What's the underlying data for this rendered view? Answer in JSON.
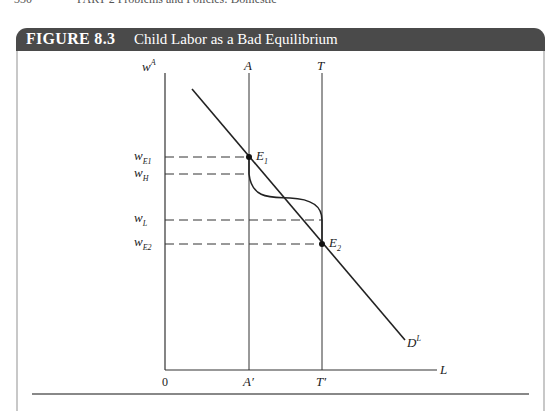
{
  "running_header": {
    "page_number": "330",
    "text": "PART 2   Problems and Policies: Domestic"
  },
  "figure": {
    "number": "FIGURE 8.3",
    "title": "Child Labor as a Bad Equilibrium",
    "colors": {
      "title_bar": "#4a4a4a",
      "title_text": "#ffffff",
      "lines": "#222222",
      "frame": "#c8c8c8"
    }
  },
  "diagram": {
    "y_axis_label": "w",
    "y_axis_sup": "A",
    "x_axis_label": "L",
    "origin_label": "0",
    "vertical_lines": [
      {
        "top_label": "A",
        "bottom_label": "A′"
      },
      {
        "top_label": "T",
        "bottom_label": "T′"
      }
    ],
    "wage_levels": [
      {
        "label": "w",
        "sub": "E1"
      },
      {
        "label": "w",
        "sub": "H"
      },
      {
        "label": "w",
        "sub": "L"
      },
      {
        "label": "w",
        "sub": "E2"
      }
    ],
    "points": [
      {
        "label": "E",
        "sub": "1"
      },
      {
        "label": "E",
        "sub": "2"
      }
    ],
    "demand_curve_label": "D",
    "demand_curve_sup": "L"
  }
}
